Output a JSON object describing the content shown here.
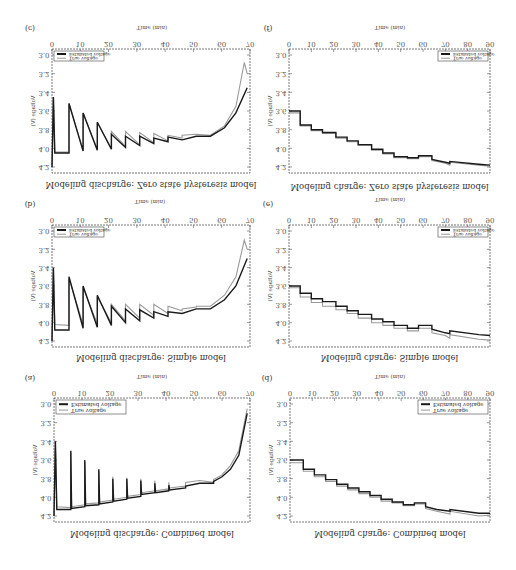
{
  "figure": {
    "orientation": "vertically flipped (mirror image)",
    "x_axis_title": "Time (min)",
    "y_axis_title": "Voltage (V)",
    "legend": [
      "Estimated voltage",
      "True voltage"
    ],
    "y_ticks": [
      "3.0",
      "3.2",
      "3.4",
      "3.6",
      "3.8",
      "4.0",
      "4.2"
    ]
  },
  "panels": [
    {
      "id": "c",
      "label": "(c)",
      "caption": "Modeling discharge: Zero state hysteresis model",
      "x_ticks": [
        "0",
        "10",
        "20",
        "30",
        "40",
        "50",
        "60",
        "70"
      ]
    },
    {
      "id": "f",
      "label": "(f)",
      "caption": "Modeling charge: Zero state hysteresis model",
      "x_ticks": [
        "0",
        "10",
        "20",
        "30",
        "40",
        "50",
        "60",
        "70",
        "80",
        "90"
      ]
    },
    {
      "id": "b",
      "label": "(b)",
      "caption": "Modeling discharge: Simple model",
      "x_ticks": [
        "0",
        "10",
        "20",
        "30",
        "40",
        "50",
        "60",
        "70"
      ]
    },
    {
      "id": "e",
      "label": "(e)",
      "caption": "Modeling charge: Simple model",
      "x_ticks": [
        "0",
        "10",
        "20",
        "30",
        "40",
        "50",
        "60",
        "70",
        "80",
        "90"
      ]
    },
    {
      "id": "a",
      "label": "(a)",
      "caption": "Modeling discharge: Combined model",
      "x_ticks": [
        "0",
        "10",
        "20",
        "30",
        "40",
        "50",
        "60",
        "70"
      ]
    },
    {
      "id": "d",
      "label": "(d)",
      "caption": "Modeling charge: Combined model",
      "x_ticks": [
        "0",
        "10",
        "20",
        "30",
        "40",
        "50",
        "60",
        "70",
        "80",
        "90"
      ]
    }
  ],
  "chart_data": [
    {
      "type": "line",
      "panel": "(a)",
      "title": "Modeling discharge: Combined model",
      "xlabel": "Time (min)",
      "ylabel": "Voltage (V)",
      "xlim": [
        0,
        70
      ],
      "ylim": [
        3.0,
        4.2
      ],
      "legend": [
        "Estimated voltage",
        "True voltage"
      ],
      "series": [
        {
          "name": "Estimated voltage",
          "x": [
            0,
            0.5,
            1,
            6,
            6,
            6.3,
            11,
            11,
            11.3,
            16,
            16,
            16.3,
            21,
            21,
            21.3,
            26,
            26,
            26.3,
            31,
            31,
            31.3,
            36,
            36,
            36.3,
            41,
            41,
            41.3,
            47,
            47,
            52,
            57,
            57,
            60,
            63,
            66,
            69
          ],
          "y": [
            4.2,
            3.4,
            4.13,
            4.13,
            3.5,
            4.12,
            4.1,
            3.6,
            4.09,
            4.08,
            3.7,
            4.07,
            4.05,
            3.8,
            4.04,
            4.02,
            3.8,
            4.01,
            3.99,
            3.82,
            3.97,
            3.95,
            3.85,
            3.95,
            3.93,
            3.87,
            3.92,
            3.9,
            3.88,
            3.85,
            3.85,
            3.83,
            3.78,
            3.7,
            3.55,
            3.1
          ]
        },
        {
          "name": "True voltage",
          "x": [
            0,
            0.5,
            1,
            6,
            6,
            6.3,
            11,
            11,
            11.3,
            16,
            16,
            16.3,
            21,
            21,
            21.3,
            26,
            26,
            26.3,
            31,
            31,
            31.3,
            36,
            36,
            36.3,
            41,
            41,
            41.3,
            47,
            47,
            52,
            57,
            57,
            60,
            63,
            66,
            69
          ],
          "y": [
            4.2,
            3.42,
            4.1,
            4.11,
            3.52,
            4.1,
            4.08,
            3.62,
            4.07,
            4.06,
            3.72,
            4.05,
            4.03,
            3.78,
            4.02,
            4.0,
            3.79,
            3.99,
            3.97,
            3.8,
            3.95,
            3.93,
            3.82,
            3.93,
            3.91,
            3.84,
            3.9,
            3.88,
            3.84,
            3.82,
            3.84,
            3.81,
            3.76,
            3.66,
            3.5,
            3.05
          ]
        }
      ]
    },
    {
      "type": "line",
      "panel": "(b)",
      "title": "Modeling discharge: Simple model",
      "xlabel": "Time (min)",
      "ylabel": "Voltage (V)",
      "xlim": [
        0,
        70
      ],
      "ylim": [
        3.0,
        4.2
      ],
      "legend": [
        "Estimated voltage",
        "True voltage"
      ],
      "series": [
        {
          "name": "Estimated voltage",
          "x": [
            0,
            0.5,
            1,
            6,
            6,
            11,
            11,
            16,
            16,
            21,
            21,
            26,
            26,
            31,
            31,
            36,
            36,
            41,
            41,
            46,
            46,
            51,
            51,
            56,
            61,
            65,
            69
          ],
          "y": [
            4.2,
            3.4,
            4.08,
            4.08,
            3.5,
            4.06,
            3.6,
            4.05,
            3.7,
            4.03,
            3.82,
            4.0,
            3.85,
            3.98,
            3.86,
            3.95,
            3.88,
            3.93,
            3.88,
            3.9,
            3.9,
            3.85,
            3.85,
            3.85,
            3.75,
            3.6,
            3.3
          ]
        },
        {
          "name": "True voltage",
          "x": [
            0,
            0.5,
            1,
            6,
            6,
            11,
            11,
            16,
            16,
            21,
            21,
            26,
            26,
            31,
            31,
            36,
            36,
            41,
            41,
            46,
            46,
            51,
            51,
            56,
            61,
            65,
            68,
            69
          ],
          "y": [
            4.2,
            3.42,
            4.02,
            4.03,
            3.52,
            4.02,
            3.62,
            4.01,
            3.72,
            4.0,
            3.8,
            3.98,
            3.8,
            3.95,
            3.8,
            3.92,
            3.8,
            3.9,
            3.82,
            3.87,
            3.85,
            3.83,
            3.82,
            3.82,
            3.7,
            3.5,
            3.1,
            3.2
          ]
        }
      ]
    },
    {
      "type": "line",
      "panel": "(c)",
      "title": "Modeling discharge: Zero state hysteresis model",
      "xlabel": "Time (min)",
      "ylabel": "Voltage (V)",
      "xlim": [
        0,
        70
      ],
      "ylim": [
        3.0,
        4.2
      ],
      "legend": [
        "Estimated voltage",
        "True voltage"
      ],
      "series": [
        {
          "name": "Estimated voltage",
          "x": [
            0,
            0.5,
            1,
            6,
            6,
            11,
            11,
            16,
            16,
            21,
            21,
            26,
            26,
            31,
            31,
            36,
            36,
            41,
            41,
            46,
            46,
            51,
            51,
            56,
            61,
            65,
            69
          ],
          "y": [
            4.2,
            3.45,
            4.05,
            4.05,
            3.52,
            4.03,
            3.62,
            4.02,
            3.72,
            4.01,
            3.85,
            3.99,
            3.87,
            3.97,
            3.87,
            3.95,
            3.89,
            3.93,
            3.88,
            3.91,
            3.91,
            3.87,
            3.87,
            3.87,
            3.78,
            3.62,
            3.35
          ]
        },
        {
          "name": "True voltage",
          "x": [
            0,
            0.5,
            1,
            6,
            6,
            11,
            11,
            16,
            16,
            21,
            21,
            26,
            26,
            31,
            31,
            36,
            36,
            41,
            41,
            46,
            46,
            51,
            51,
            56,
            61,
            65,
            68,
            69
          ],
          "y": [
            4.2,
            3.45,
            4.04,
            4.04,
            3.52,
            4.02,
            3.62,
            4.01,
            3.72,
            4.0,
            3.82,
            3.98,
            3.82,
            3.96,
            3.83,
            3.94,
            3.84,
            3.92,
            3.86,
            3.89,
            3.86,
            3.85,
            3.85,
            3.86,
            3.76,
            3.55,
            3.08,
            3.2
          ]
        }
      ]
    },
    {
      "type": "line",
      "panel": "(d)",
      "title": "Modeling charge: Combined model",
      "xlabel": "Time (min)",
      "ylabel": "Voltage (V)",
      "xlim": [
        0,
        90
      ],
      "ylim": [
        3.0,
        4.2
      ],
      "legend": [
        "Estimated voltage",
        "True voltage"
      ],
      "series": [
        {
          "name": "Estimated voltage",
          "x": [
            0,
            6,
            6,
            11,
            11,
            16,
            16,
            21,
            21,
            26,
            26,
            31,
            31,
            36,
            36,
            41,
            41,
            46,
            46,
            51,
            51,
            56,
            56,
            61,
            61,
            66,
            72,
            72,
            85,
            90
          ],
          "y": [
            3.6,
            3.6,
            3.7,
            3.7,
            3.76,
            3.76,
            3.81,
            3.81,
            3.86,
            3.86,
            3.9,
            3.9,
            3.94,
            3.94,
            3.98,
            3.98,
            4.02,
            4.02,
            4.05,
            4.05,
            4.08,
            4.08,
            4.06,
            4.06,
            4.1,
            4.13,
            4.15,
            4.13,
            4.17,
            4.17
          ]
        },
        {
          "name": "True voltage",
          "x": [
            0,
            6,
            6,
            11,
            11,
            16,
            16,
            21,
            21,
            26,
            26,
            31,
            31,
            36,
            36,
            41,
            41,
            46,
            46,
            51,
            51,
            56,
            56,
            61,
            61,
            66,
            72,
            72,
            85,
            90
          ],
          "y": [
            3.63,
            3.63,
            3.72,
            3.72,
            3.78,
            3.78,
            3.83,
            3.83,
            3.88,
            3.88,
            3.92,
            3.92,
            3.96,
            3.96,
            4.0,
            4.0,
            4.04,
            4.04,
            4.06,
            4.06,
            4.09,
            4.09,
            4.07,
            4.07,
            4.12,
            4.15,
            4.18,
            4.15,
            4.2,
            4.19
          ]
        }
      ]
    },
    {
      "type": "line",
      "panel": "(e)",
      "title": "Modeling charge: Simple model",
      "xlabel": "Time (min)",
      "ylabel": "Voltage (V)",
      "xlim": [
        0,
        90
      ],
      "ylim": [
        3.0,
        4.2
      ],
      "legend": [
        "Estimated voltage",
        "True voltage"
      ],
      "series": [
        {
          "name": "Estimated voltage",
          "x": [
            0,
            5,
            5,
            10,
            10,
            15,
            15,
            21,
            21,
            26,
            26,
            31,
            31,
            37,
            37,
            42,
            42,
            47,
            47,
            53,
            53,
            58,
            58,
            64,
            64,
            70,
            72,
            72,
            85,
            90
          ],
          "y": [
            3.6,
            3.6,
            3.68,
            3.68,
            3.74,
            3.74,
            3.77,
            3.77,
            3.82,
            3.82,
            3.87,
            3.87,
            3.91,
            3.91,
            3.96,
            3.96,
            3.99,
            3.99,
            4.03,
            4.03,
            4.06,
            4.06,
            4.03,
            4.03,
            4.07,
            4.11,
            4.12,
            4.09,
            4.13,
            4.14
          ]
        },
        {
          "name": "True voltage",
          "x": [
            0,
            5,
            5,
            10,
            10,
            15,
            15,
            21,
            21,
            26,
            26,
            31,
            31,
            37,
            37,
            42,
            42,
            47,
            47,
            53,
            53,
            58,
            58,
            64,
            64,
            70,
            72,
            72,
            85,
            90
          ],
          "y": [
            3.62,
            3.62,
            3.72,
            3.72,
            3.78,
            3.78,
            3.82,
            3.82,
            3.86,
            3.86,
            3.9,
            3.9,
            3.95,
            3.95,
            4.0,
            4.0,
            4.03,
            4.03,
            4.06,
            4.06,
            4.09,
            4.09,
            4.06,
            4.06,
            4.11,
            4.14,
            4.17,
            4.13,
            4.18,
            4.19
          ]
        }
      ]
    },
    {
      "type": "line",
      "panel": "(f)",
      "title": "Modeling charge: Zero state hysteresis model",
      "xlabel": "Time (min)",
      "ylabel": "Voltage (V)",
      "xlim": [
        0,
        90
      ],
      "ylim": [
        3.0,
        4.2
      ],
      "legend": [
        "Estimated voltage",
        "True voltage"
      ],
      "series": [
        {
          "name": "Estimated voltage",
          "x": [
            0,
            5,
            5,
            10,
            10,
            15,
            15,
            21,
            21,
            26,
            26,
            31,
            31,
            37,
            37,
            42,
            42,
            47,
            47,
            53,
            53,
            58,
            58,
            64,
            64,
            70,
            72,
            72,
            85,
            90
          ],
          "y": [
            3.6,
            3.6,
            3.75,
            3.75,
            3.8,
            3.8,
            3.83,
            3.83,
            3.88,
            3.88,
            3.92,
            3.92,
            3.96,
            3.96,
            4.01,
            4.01,
            4.05,
            4.05,
            4.09,
            4.09,
            4.1,
            4.1,
            4.08,
            4.08,
            4.12,
            4.15,
            4.16,
            4.14,
            4.17,
            4.18
          ]
        },
        {
          "name": "True voltage",
          "x": [
            0,
            5,
            5,
            10,
            10,
            15,
            15,
            21,
            21,
            26,
            26,
            31,
            31,
            37,
            37,
            42,
            42,
            47,
            47,
            53,
            53,
            58,
            58,
            64,
            64,
            70,
            72,
            72,
            85,
            90
          ],
          "y": [
            3.62,
            3.62,
            3.76,
            3.76,
            3.81,
            3.81,
            3.84,
            3.84,
            3.89,
            3.89,
            3.93,
            3.93,
            3.97,
            3.97,
            4.02,
            4.02,
            4.06,
            4.06,
            4.1,
            4.1,
            4.11,
            4.11,
            4.09,
            4.09,
            4.13,
            4.16,
            4.18,
            4.15,
            4.18,
            4.19
          ]
        }
      ]
    }
  ]
}
